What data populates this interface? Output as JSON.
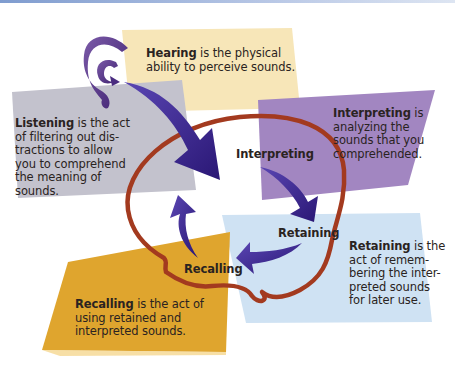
{
  "diagram": {
    "colors": {
      "hearing_panel": "#f7e6b8",
      "listening_panel": "#c3c2cd",
      "interpreting_panel": "#a286c1",
      "retaining_panel": "#cfe2f3",
      "recalling_panel": "#dfa52e",
      "arrow": "#3a2391",
      "head_outline": "#a33a1f",
      "ear": "#5d3b8e",
      "text": "#2a2321"
    },
    "panels": {
      "hearing": {
        "term": "Hearing",
        "definition_lines": [
          " is the physical",
          "ability to perceive sounds."
        ]
      },
      "listening": {
        "term": "Listening",
        "definition_lines": [
          " is the act",
          "of filtering out dis-",
          "tractions to allow",
          "you to comprehend",
          "the meaning of",
          "sounds."
        ]
      },
      "interpreting": {
        "term": "Interpreting",
        "definition_lines": [
          " is",
          "analyzing the",
          "sounds that you",
          "comprehended."
        ]
      },
      "retaining": {
        "term": "Retaining",
        "definition_lines": [
          " is the",
          "act of remem-",
          "bering the inter-",
          "preted sounds",
          "for later use."
        ]
      },
      "recalling": {
        "term": "Recalling",
        "definition_lines": [
          " is the act of",
          "using retained and",
          "interpreted sounds."
        ]
      }
    },
    "cycle_labels": {
      "interpreting": "Interpreting",
      "retaining": "Retaining",
      "recalling": "Recalling"
    },
    "icons": [
      "ear-icon",
      "head-outline-icon",
      "cycle-arrow-icon"
    ]
  }
}
